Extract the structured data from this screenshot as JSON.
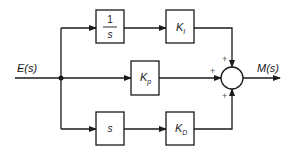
{
  "diagram": {
    "type": "block-diagram",
    "input_label": "E(s)",
    "output_label": "M(s)",
    "blocks": {
      "integrator": {
        "numerator": "1",
        "denominator": "s"
      },
      "integral_gain": {
        "main": "K",
        "sub": "I"
      },
      "proportional_gain": {
        "main": "K",
        "sub": "p"
      },
      "differentiator": {
        "label": "s"
      },
      "derivative_gain": {
        "main": "K",
        "sub": "D"
      }
    },
    "summing_junction": {
      "signs": {
        "top": "+",
        "left": "+",
        "bottom": "+"
      }
    },
    "colors": {
      "stroke": "#1a1a1a",
      "sign": "#555555",
      "background": "#ffffff"
    }
  }
}
